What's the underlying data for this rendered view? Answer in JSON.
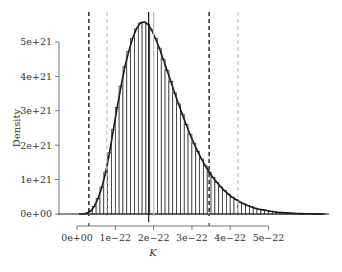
{
  "chart_data": {
    "type": "bar",
    "subtype": "histogram",
    "title": "",
    "xlabel": "K",
    "ylabel": "Density",
    "xlim": [
      0,
      6.5e-22
    ],
    "ylim": [
      0,
      5.6e+21
    ],
    "grid": false,
    "legend": null,
    "x_ticks": [
      {
        "value": 0,
        "label": "0e+00"
      },
      {
        "value": 1e-22,
        "label": "1e−22"
      },
      {
        "value": 2e-22,
        "label": "2e−22"
      },
      {
        "value": 3e-22,
        "label": "3e−22"
      },
      {
        "value": 4e-22,
        "label": "4e−22"
      },
      {
        "value": 5e-22,
        "label": "5e−22"
      }
    ],
    "y_ticks": [
      {
        "value": 0,
        "label": "0e+00"
      },
      {
        "value": 1e+21,
        "label": "1e+21"
      },
      {
        "value": 2e+21,
        "label": "2e+21"
      },
      {
        "value": 3e+21,
        "label": "3e+21"
      },
      {
        "value": 4e+21,
        "label": "4e+21"
      },
      {
        "value": 5e+21,
        "label": "5e+21"
      }
    ],
    "bin_width": 1e-23,
    "bin_start": 0,
    "units_x": 1e-22,
    "units_y": 1e+21,
    "values": [
      0.0,
      0.0,
      0.02,
      0.08,
      0.22,
      0.45,
      0.78,
      1.22,
      1.78,
      2.45,
      3.1,
      3.72,
      4.28,
      4.72,
      5.1,
      5.38,
      5.55,
      5.58,
      5.52,
      5.35,
      5.1,
      4.82,
      4.5,
      4.18,
      3.85,
      3.52,
      3.2,
      2.9,
      2.6,
      2.32,
      2.06,
      1.82,
      1.6,
      1.4,
      1.22,
      1.06,
      0.92,
      0.79,
      0.68,
      0.58,
      0.49,
      0.42,
      0.35,
      0.3,
      0.25,
      0.21,
      0.17,
      0.14,
      0.12,
      0.1,
      0.08,
      0.065,
      0.05,
      0.04,
      0.032,
      0.025,
      0.02,
      0.015,
      0.011,
      0.008,
      0.006,
      0.004,
      0.003,
      0.002,
      0.001
    ],
    "reference_lines": [
      {
        "name": "lower-interval-dashed",
        "x": 3.1e-23,
        "style": "dashed",
        "color": "#1a1a1a"
      },
      {
        "name": "upper-interval-dashed",
        "x": 3.45e-22,
        "style": "dashed",
        "color": "#1a1a1a"
      },
      {
        "name": "lower-interval-grey-dashed",
        "x": 7.8e-23,
        "style": "dashed",
        "color": "#c8c8c8"
      },
      {
        "name": "upper-interval-grey-dashed",
        "x": 4.2e-22,
        "style": "dashed",
        "color": "#c8c8c8"
      },
      {
        "name": "median-solid",
        "x": 1.87e-22,
        "style": "solid",
        "color": "#1a1a1a"
      },
      {
        "name": "reference-grey-solid",
        "x": 2e-22,
        "style": "solid",
        "color": "#bbbbbb"
      }
    ]
  },
  "colors": {
    "bar_fill": "#ffffff",
    "bar_stroke": "#222222",
    "outline": "#1a1a1a",
    "axis": "#555555",
    "text": "#333333"
  }
}
